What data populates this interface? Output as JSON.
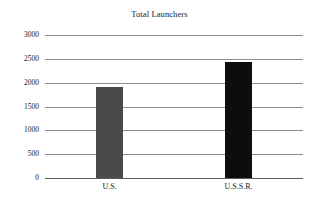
{
  "chart_data": {
    "type": "bar",
    "title": "Total Launchers",
    "xlabel": "",
    "ylabel": "",
    "categories": [
      "U.S.",
      "U.S.S.R."
    ],
    "values": [
      1900,
      2440
    ],
    "series": [
      {
        "name": "Total Launchers",
        "values": [
          1900,
          2440
        ]
      }
    ],
    "bar_colors": [
      "#4a4a4a",
      "#0d0d0d"
    ],
    "ylim": [
      0,
      3000
    ],
    "yticks": [
      0,
      500,
      1000,
      1500,
      2000,
      2500,
      3000
    ],
    "ytick_labels": [
      "0",
      "500",
      "1000",
      "1500",
      "2000",
      "2500",
      "3000"
    ],
    "grid": true,
    "grid_axis": "y",
    "grid_color": "#8f8f8f",
    "legend": false,
    "legend_position": "none",
    "background_color": "#ffffff",
    "text_color": "#1a1a1a"
  },
  "bars": [
    {
      "label": "U.S.",
      "value": 1900,
      "color": "#4a4a4a"
    },
    {
      "label": "U.S.S.R.",
      "value": 2440,
      "color": "#0d0d0d"
    }
  ]
}
